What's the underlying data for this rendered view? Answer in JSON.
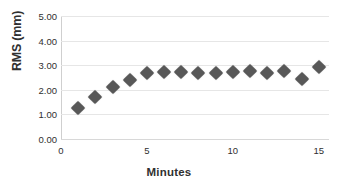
{
  "chart_data": {
    "type": "scatter",
    "title": "",
    "xlabel": "Minutes",
    "ylabel": "RMS (mm)",
    "xlim": [
      0,
      15.6
    ],
    "ylim": [
      0,
      5
    ],
    "grid": true,
    "legend": "none",
    "marker": "diamond",
    "marker_color": "#585858",
    "gridline_color": "#e6e6e6",
    "axis_color": "#cfcfcf",
    "background": "#ffffff",
    "x_ticks": [
      "0",
      "5",
      "10",
      "15"
    ],
    "x_tick_values": [
      0,
      5,
      10,
      15
    ],
    "y_ticks": [
      "0.00",
      "1.00",
      "2.00",
      "3.00",
      "4.00",
      "5.00"
    ],
    "y_tick_values": [
      0,
      1,
      2,
      3,
      4,
      5
    ],
    "x": [
      1,
      2,
      3,
      4,
      5,
      6,
      7,
      8,
      9,
      10,
      11,
      12,
      13,
      14,
      15
    ],
    "values": [
      1.28,
      1.72,
      2.11,
      2.4,
      2.67,
      2.74,
      2.74,
      2.7,
      2.68,
      2.71,
      2.77,
      2.7,
      2.75,
      2.44,
      2.93
    ],
    "points": [
      {
        "x": 1,
        "y": 1.28
      },
      {
        "x": 2,
        "y": 1.72
      },
      {
        "x": 3,
        "y": 2.11
      },
      {
        "x": 4,
        "y": 2.4
      },
      {
        "x": 5,
        "y": 2.67
      },
      {
        "x": 6,
        "y": 2.74
      },
      {
        "x": 7,
        "y": 2.74
      },
      {
        "x": 8,
        "y": 2.7
      },
      {
        "x": 9,
        "y": 2.68
      },
      {
        "x": 10,
        "y": 2.71
      },
      {
        "x": 11,
        "y": 2.77
      },
      {
        "x": 12,
        "y": 2.7
      },
      {
        "x": 13,
        "y": 2.75
      },
      {
        "x": 14,
        "y": 2.44
      },
      {
        "x": 15,
        "y": 2.93
      }
    ]
  }
}
